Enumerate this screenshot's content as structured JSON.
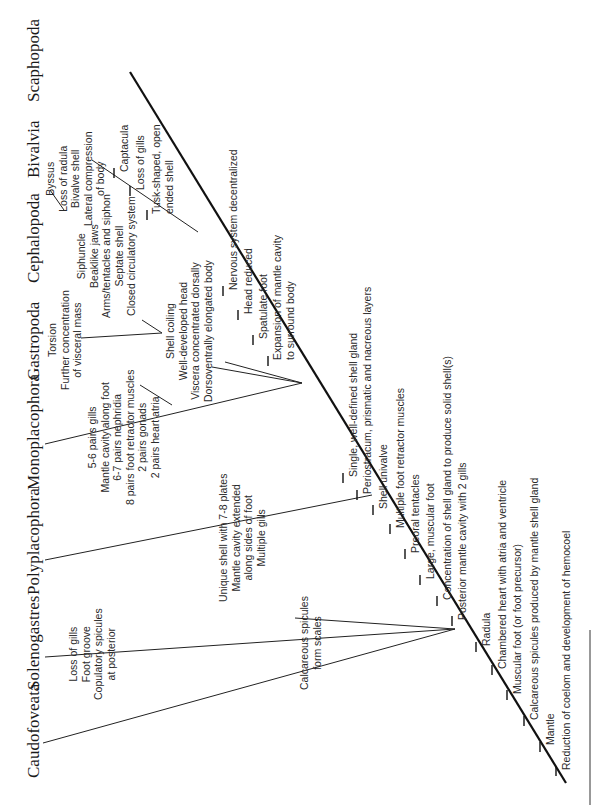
{
  "diagram": {
    "type": "cladogram",
    "orientation": "rotated -90deg (root at bottom-right, tips at top-left)",
    "taxa": [
      {
        "name": "Caudofoveata"
      },
      {
        "name": "Solenogastres"
      },
      {
        "name": "Polyplacophora"
      },
      {
        "name": "Monoplacophora"
      },
      {
        "name": "Gastropoda"
      },
      {
        "name": "Cephalopoda"
      },
      {
        "name": "Bivalvia"
      },
      {
        "name": "Scaphopoda"
      }
    ],
    "trunk_characters": [
      "Reduction of coelom and development of hemocoel",
      "Mantle",
      "Calcareous spicules produced by mantle shell gland",
      "Muscular foot (or foot precursor)",
      "Chambered heart with atria and ventricle",
      "Radula",
      "Posterior mantle cavity with 2 gills",
      "Concentration of shell gland to produce solid shell(s)",
      "Large, muscular foot",
      "Preoral tentacles",
      "Multiple foot retractor muscles",
      "Shell univalve",
      "Periostracum, prismatic and nacreous layers",
      "Single, well-defined shell gland",
      "Expansion of mantle cavity",
      "to surround body",
      "Spatulate foot",
      "Head reduced",
      "Nervous system decentralized",
      "Tusk-shaped, open",
      "ended shell",
      "Loss of gills",
      "Captacula"
    ],
    "caudofoveata_solenogastres_shared": [
      "Calcareous spicules",
      "form scales"
    ],
    "solenogastres_chars": [
      "Loss of gills",
      "Foot groove",
      "Copulatory spicules",
      "at posterior"
    ],
    "polyplacophora_chars": [
      "Unique shell with 7-8 plates",
      "Mantle cavity extended",
      "along sides of foot",
      "Multiple gills"
    ],
    "monoplacophora_chars": [
      "5-6 pairs gills",
      "Mantle cavity along foot",
      "6-7 pairs nephridia",
      "8 pairs foot retractor muscles",
      "2 pairs gonads",
      "2 pairs heart atria"
    ],
    "gastropoda_cephalopoda_shared": [
      "Shell coiling",
      "Well-developed head",
      "Viscera concentrated dorsally",
      "Dorsoventrally elongated body"
    ],
    "gastropoda_chars": [
      "Torsion",
      "Further concentration",
      "of visceral mass"
    ],
    "cephalopoda_chars": [
      "Siphuncle",
      "Beaklike jaws",
      "Arms/tentacles and siphon",
      "Septate shell",
      "Closed circulatory system"
    ],
    "bivalvia_chars": [
      "Byssus",
      "Loss of radula",
      "Bivalve shell",
      "Lateral compression",
      "of body"
    ],
    "colors": {
      "line": "#111111",
      "text": "#2a2a2a",
      "background": "#ffffff"
    }
  }
}
